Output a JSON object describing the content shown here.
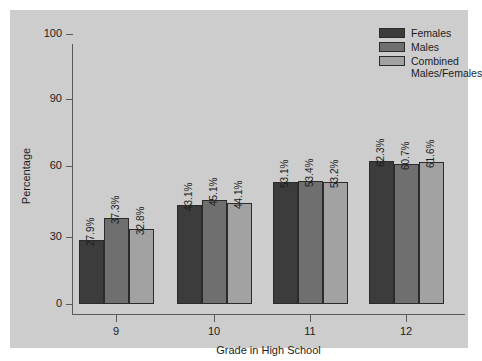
{
  "chart_data": {
    "type": "bar",
    "title": "",
    "xlabel": "Grade in High School",
    "ylabel": "Percentage",
    "categories": [
      "9",
      "10",
      "11",
      "12"
    ],
    "yticks": [
      0,
      30,
      60,
      90,
      100
    ],
    "ytick_labels": [
      "0",
      "30",
      "60",
      "90",
      "100"
    ],
    "ylim": [
      0,
      100
    ],
    "grid": false,
    "legend_position": "top-right",
    "series": [
      {
        "name": "Females",
        "color": "#3c3c3c",
        "values": [
          27.9,
          43.1,
          53.1,
          62.3
        ],
        "labels": [
          "27.9%",
          "43.1%",
          "53.1%",
          "62.3%"
        ]
      },
      {
        "name": "Males",
        "color": "#6f6f6f",
        "values": [
          37.3,
          45.1,
          53.4,
          60.7
        ],
        "labels": [
          "37.3%",
          "45.1%",
          "53.4%",
          "60.7%"
        ]
      },
      {
        "name": "Combined\nMales/Females",
        "color": "#a2a2a2",
        "values": [
          32.8,
          44.1,
          53.2,
          61.6
        ],
        "labels": [
          "32.8%",
          "44.1%",
          "53.2%",
          "61.6%"
        ]
      }
    ]
  },
  "colors": {
    "figure_background": "#ffffff",
    "panel_background": "#cdcdcd",
    "axis": "#5a5a5a",
    "text": "#1c1c1c",
    "bar_outline": "#2b2b2b"
  },
  "axis": {
    "y_title": "Percentage",
    "x_title": "Grade in High School"
  },
  "legend": {
    "items": [
      {
        "label": "Females",
        "color": "#3c3c3c"
      },
      {
        "label": "Males",
        "color": "#6f6f6f"
      },
      {
        "label": "Combined\nMales/Females",
        "color": "#a2a2a2"
      }
    ]
  }
}
